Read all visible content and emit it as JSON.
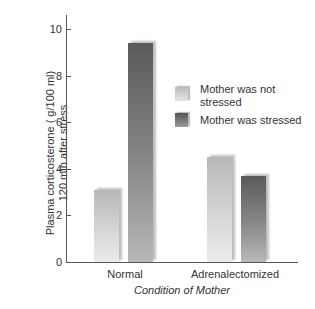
{
  "chart_data": {
    "type": "bar",
    "title": "",
    "xlabel": "Condition of Mother",
    "ylabel": "Plasma corticosterone ( g/100 ml)\n120 min after stress",
    "ylabel_line1": "Plasma corticosterone ( g/100 ml)",
    "ylabel_line2": "120 min after stress",
    "categories": [
      "Normal",
      "Adrenalectomized"
    ],
    "series": [
      {
        "name": "Mother was not stressed",
        "values": [
          3.1,
          4.5
        ],
        "color": "#cfcfcf"
      },
      {
        "name": "Mother was stressed",
        "values": [
          9.4,
          3.7
        ],
        "color": "#6e6e6e"
      }
    ],
    "ylim": [
      0,
      10
    ],
    "yticks": [
      0,
      2,
      4,
      6,
      8,
      10
    ],
    "grid": false,
    "legend_position": "upper right inside"
  },
  "legend": {
    "item0_line1": "Mother was not",
    "item0_line2": "stressed",
    "item1": "Mother was stressed"
  }
}
